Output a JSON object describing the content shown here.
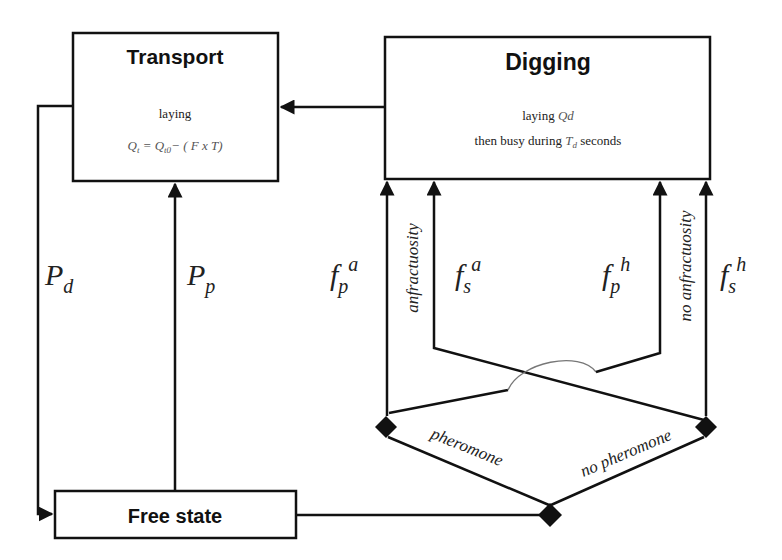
{
  "boxes": {
    "transport": {
      "title": "Transport",
      "line1": "laying",
      "formula": {
        "lhs": "Q",
        "lhs_sub": "t",
        "eq": " = ",
        "rhs": "Q",
        "rhs_sub": "t0",
        "rest": "− ( F x T)"
      }
    },
    "digging": {
      "title": "Digging",
      "line1_prefix": "laying ",
      "line1_var": "Qd",
      "line2_prefix": "then busy during ",
      "line2_var": "T",
      "line2_sub": "d",
      "line2_suffix": " seconds"
    },
    "free_state": {
      "title": "Free state"
    }
  },
  "edge_labels": {
    "pd": {
      "base": "P",
      "sub": "d"
    },
    "pp": {
      "base": "P",
      "sub": "p"
    },
    "fpa": {
      "base": "f",
      "sub": "p",
      "sup": "a"
    },
    "fsa": {
      "base": "f",
      "sub": "s",
      "sup": "a"
    },
    "fph": {
      "base": "f",
      "sub": "p",
      "sup": "h"
    },
    "fsh": {
      "base": "f",
      "sub": "s",
      "sup": "h"
    }
  },
  "branch_labels": {
    "anfractuosity": "anfractuosity",
    "no_anfractuosity": "no anfractuosity",
    "pheromone": "pheromone",
    "no_pheromone": "no pheromone"
  },
  "colors": {
    "stroke": "#111111",
    "text": "#222222",
    "formula": "#555555",
    "hop": "#777777"
  }
}
